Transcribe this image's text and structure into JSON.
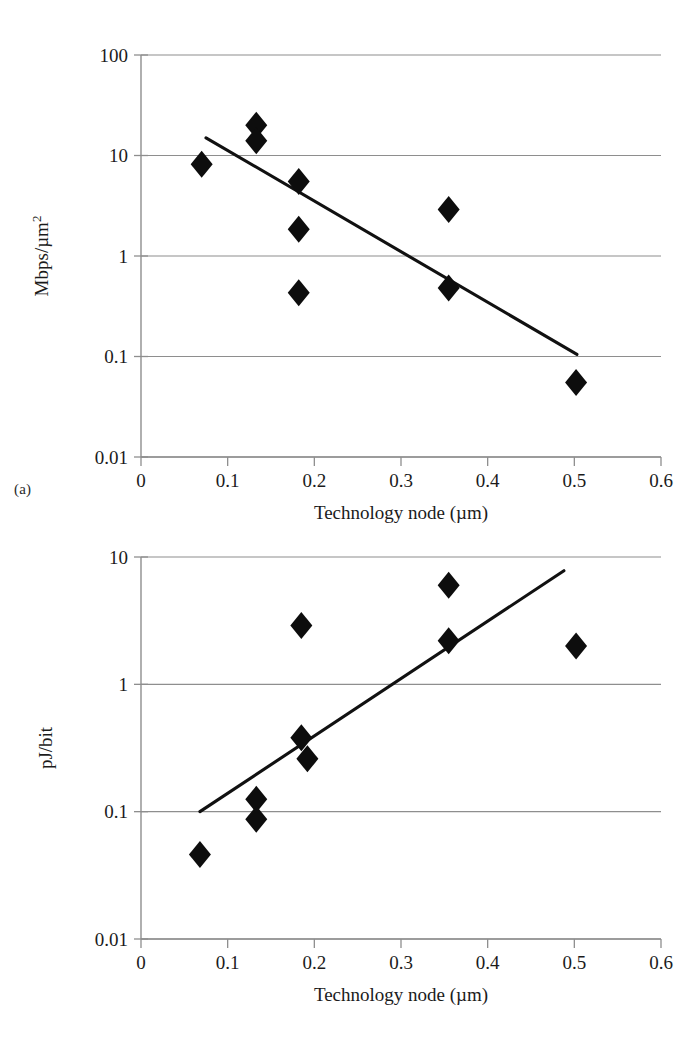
{
  "figure": {
    "panel_a_tag": "(a)",
    "panel_b_tag": "(b)"
  },
  "chart_data": [
    {
      "id": "panel-a",
      "type": "scatter",
      "title": "",
      "xlabel": "Technology node (µm)",
      "ylabel": "Mbps/µm²",
      "ylabel_base": "Mbps/µm",
      "ylabel_exponent": "2",
      "xlim": [
        0,
        0.6
      ],
      "ylim": [
        0.01,
        100
      ],
      "yscale": "log",
      "xscale": "linear",
      "grid": "horizontal",
      "legend": "none",
      "xticks": [
        "0",
        "0.1",
        "0.2",
        "0.3",
        "0.4",
        "0.5",
        "0.6"
      ],
      "xtick_values": [
        0,
        0.1,
        0.2,
        0.3,
        0.4,
        0.5,
        0.6
      ],
      "yticks": [
        "100",
        "10",
        "1",
        "0.1",
        "0.01"
      ],
      "ytick_values": [
        100,
        10,
        1,
        0.1,
        0.01
      ],
      "marker": "filled-diamond",
      "marker_color": "#0d0d0d",
      "points": [
        {
          "x": 0.07,
          "y": 8.2
        },
        {
          "x": 0.133,
          "y": 20.0
        },
        {
          "x": 0.133,
          "y": 14.0
        },
        {
          "x": 0.182,
          "y": 5.5
        },
        {
          "x": 0.182,
          "y": 1.85
        },
        {
          "x": 0.182,
          "y": 0.43
        },
        {
          "x": 0.355,
          "y": 2.9
        },
        {
          "x": 0.355,
          "y": 0.48
        },
        {
          "x": 0.502,
          "y": 0.055
        }
      ],
      "trendline": {
        "color": "#111111",
        "from": {
          "x": 0.075,
          "y": 15.0
        },
        "to": {
          "x": 0.503,
          "y": 0.105
        }
      }
    },
    {
      "id": "panel-b",
      "type": "scatter",
      "title": "",
      "xlabel": "Technology node (µm)",
      "ylabel": "pJ/bit",
      "xlim": [
        0,
        0.6
      ],
      "ylim": [
        0.01,
        10
      ],
      "yscale": "log",
      "xscale": "linear",
      "grid": "horizontal",
      "legend": "none",
      "xticks": [
        "0",
        "0.1",
        "0.2",
        "0.3",
        "0.4",
        "0.5",
        "0.6"
      ],
      "xtick_values": [
        0,
        0.1,
        0.2,
        0.3,
        0.4,
        0.5,
        0.6
      ],
      "yticks": [
        "10",
        "1",
        "0.1",
        "0.01"
      ],
      "ytick_values": [
        10,
        1,
        0.1,
        0.01
      ],
      "marker": "filled-diamond",
      "marker_color": "#0d0d0d",
      "points": [
        {
          "x": 0.068,
          "y": 0.046
        },
        {
          "x": 0.133,
          "y": 0.125
        },
        {
          "x": 0.133,
          "y": 0.087
        },
        {
          "x": 0.185,
          "y": 2.9
        },
        {
          "x": 0.185,
          "y": 0.38
        },
        {
          "x": 0.192,
          "y": 0.26
        },
        {
          "x": 0.355,
          "y": 6.0
        },
        {
          "x": 0.355,
          "y": 2.2
        },
        {
          "x": 0.502,
          "y": 2.0
        }
      ],
      "trendline": {
        "color": "#111111",
        "from": {
          "x": 0.068,
          "y": 0.1
        },
        "to": {
          "x": 0.488,
          "y": 7.8
        }
      }
    }
  ]
}
